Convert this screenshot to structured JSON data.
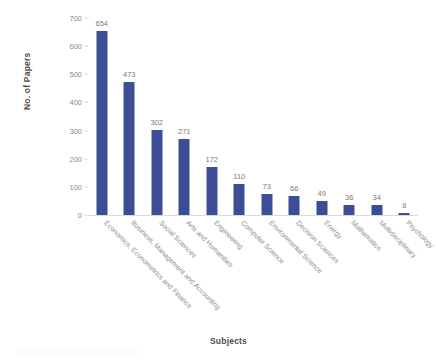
{
  "chart_data": {
    "type": "bar",
    "title": "",
    "xlabel": "Subjects",
    "ylabel": "No. of Papers",
    "ylim": [
      0,
      700
    ],
    "yticks": [
      0,
      100,
      200,
      300,
      400,
      500,
      600,
      700
    ],
    "grid": false,
    "legend": null,
    "bar_color": "#3c4e97",
    "label_color": "#7a7a7a",
    "categories": [
      "Economics, Econometrics and Finance",
      "Business, Management and Accounting",
      "Social Sciences",
      "Arts and Humanities",
      "Engineering",
      "Computer Science",
      "Environmental Science",
      "Decision Sciences",
      "Energy",
      "Mathematics",
      "Multidisciplinary",
      "Psychology"
    ],
    "values": [
      654,
      473,
      302,
      271,
      172,
      110,
      73,
      66,
      49,
      36,
      34,
      8
    ],
    "data_labels": [
      "654",
      "473",
      "302",
      "271",
      "172",
      "110",
      "73",
      "66",
      "49",
      "36",
      "34",
      "8"
    ]
  },
  "axes": {
    "y_title": "No. of Papers",
    "x_title": "Subjects",
    "y_tick_labels": [
      "0",
      "100",
      "200",
      "300",
      "400",
      "500",
      "600",
      "700"
    ]
  }
}
